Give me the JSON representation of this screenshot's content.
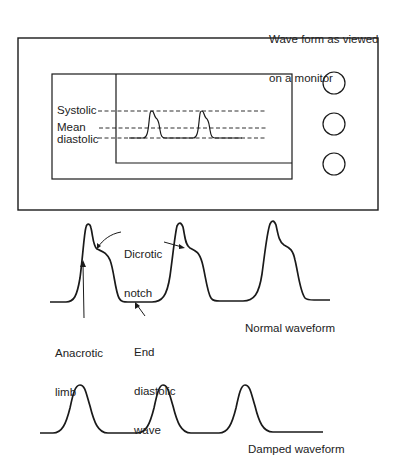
{
  "monitor": {
    "title_line1": "Wave form as viewed",
    "title_line2": "on a monitor",
    "labels": {
      "systolic": "Systolic",
      "mean": "Mean",
      "diastolic": "diastolic"
    },
    "buttons": [
      "button-1",
      "button-2",
      "button-3"
    ]
  },
  "normal": {
    "dicrotic_line1": "Dicrotic",
    "dicrotic_line2": "notch",
    "anacrotic_line1": "Anacrotic",
    "anacrotic_line2": "limb",
    "end_line1": "End",
    "end_line2": "diastolic",
    "end_line3": "wave",
    "caption": "Normal waveform"
  },
  "damped": {
    "caption": "Damped waveform"
  },
  "colors": {
    "ink": "#1a1a1a",
    "background": "#ffffff"
  }
}
